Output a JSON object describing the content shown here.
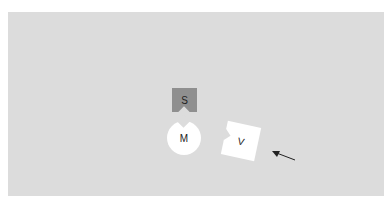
{
  "board": {
    "background": "#dcdcdc"
  },
  "pieces": [
    {
      "id": "s",
      "label": "S",
      "shape": "square",
      "color": "#8f8f8f"
    },
    {
      "id": "m",
      "label": "M",
      "shape": "circle",
      "color": "#ffffff"
    },
    {
      "id": "v",
      "label": "V",
      "shape": "square",
      "color": "#ffffff"
    }
  ],
  "pointer": {
    "icon": "arrow-icon",
    "color": "#222222"
  }
}
